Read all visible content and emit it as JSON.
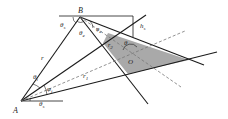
{
  "diagram": {
    "type": "geometry",
    "colors": {
      "line": "#1a1a1a",
      "dashed": "#777777",
      "shade": "#a9a9a9",
      "background": "#ffffff"
    },
    "points": {
      "A": {
        "label": "A",
        "x": 21,
        "y": 101
      },
      "B": {
        "label": "B",
        "x": 80,
        "y": 17
      },
      "O": {
        "label": "O",
        "x": 131,
        "y": 58
      }
    },
    "labels": {
      "B": "B",
      "A": "A",
      "O": "O",
      "r": "r",
      "r1": "r",
      "r1_sub": "1",
      "r2": "r",
      "r2_sub": "2",
      "hs": "h",
      "hs_sub": "s",
      "theta_s_top": "θ",
      "theta_s_top_sub": "s",
      "theta_e": "θ",
      "theta_e_sub": "e",
      "phi_e": "φ",
      "phi_e_sub": "e",
      "theta_i": "θ",
      "theta_i_sub": "i",
      "phi_i": "φ",
      "phi_i_sub": "i",
      "theta_s_bottom": "θ",
      "theta_s_bottom_sub": "s",
      "theta_center": "θ"
    }
  }
}
